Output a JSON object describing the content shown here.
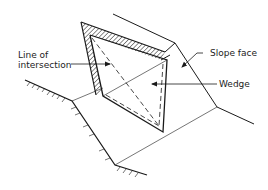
{
  "diagram": {
    "title": "",
    "type": "engineering-sketch",
    "labels": {
      "line_of_intersection_1": "Line of",
      "line_of_intersection_2": "intersection",
      "slope_face": "Slope face",
      "wedge": "Wedge"
    },
    "colors": {
      "stroke": "#1a1a1a",
      "background": "#ffffff",
      "text": "#222222"
    }
  }
}
